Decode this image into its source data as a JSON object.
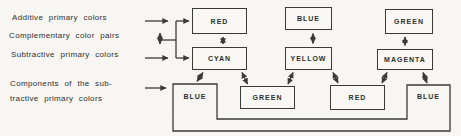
{
  "palette": {
    "ink": "#3a3a3a",
    "paper": "#f7f6f2"
  },
  "labels": {
    "additive": "Additive primary colors",
    "complementary": "Complementary color pairs",
    "subtractive": "Subtractive primary colors",
    "components_line1": "Components of the sub-",
    "components_line2": "tractive primary colors"
  },
  "additive_row": {
    "col1": "RED",
    "col2": "BLUE",
    "col3": "GREEN"
  },
  "subtractive_row": {
    "col1": "CYAN",
    "col2": "YELLOW",
    "col3": "MAGENTA"
  },
  "components_row": {
    "left": "BLUE",
    "mid_left": "GREEN",
    "mid_right": "RED",
    "right": "BLUE"
  }
}
